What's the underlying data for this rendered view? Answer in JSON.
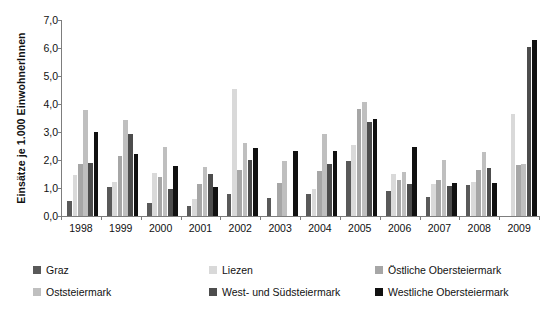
{
  "chart_data": {
    "type": "bar",
    "title": "",
    "xlabel": "",
    "ylabel": "Einsätze je 1.000 EinwohnerInnen",
    "ylim": [
      0,
      7
    ],
    "ytick_step": 1,
    "ytick_labels": [
      "0,0",
      "1,0",
      "2,0",
      "3,0",
      "4,0",
      "5,0",
      "6,0",
      "7,0"
    ],
    "ytick_values": [
      0,
      1,
      2,
      3,
      4,
      5,
      6,
      7
    ],
    "grid": false,
    "legend_position": "bottom",
    "categories": [
      "1998",
      "1999",
      "2000",
      "2001",
      "2002",
      "2003",
      "2004",
      "2005",
      "2006",
      "2007",
      "2008",
      "2009"
    ],
    "series": [
      {
        "name": "Graz",
        "color": "#595959",
        "values": [
          0.55,
          1.05,
          0.46,
          0.37,
          0.78,
          0.65,
          0.78,
          1.98,
          0.88,
          0.68,
          1.12,
          0.0
        ]
      },
      {
        "name": "Liezen",
        "color": "#d9d9d9",
        "values": [
          1.47,
          1.22,
          1.55,
          0.6,
          4.55,
          0.0,
          0.95,
          2.53,
          1.5,
          1.15,
          1.22,
          3.64
        ]
      },
      {
        "name": "Östliche Obersteiermark",
        "color": "#a6a6a6",
        "values": [
          1.84,
          2.13,
          1.38,
          1.13,
          1.63,
          1.18,
          1.6,
          3.82,
          1.3,
          1.28,
          1.64,
          1.82
        ]
      },
      {
        "name": "Oststeiermark",
        "color": "#bfbfbf",
        "values": [
          3.77,
          3.43,
          2.47,
          1.76,
          2.62,
          1.95,
          2.93,
          4.07,
          1.57,
          2.0,
          2.28,
          1.85
        ]
      },
      {
        "name": "West- und Südsteiermark",
        "color": "#4d4d4d",
        "values": [
          1.88,
          2.92,
          0.96,
          1.5,
          2.0,
          0.0,
          1.87,
          3.35,
          1.14,
          1.07,
          1.7,
          6.03
        ]
      },
      {
        "name": "Westliche Obersteiermark",
        "color": "#111111",
        "values": [
          3.01,
          2.22,
          1.79,
          1.03,
          2.42,
          2.32,
          2.31,
          3.48,
          2.47,
          1.17,
          1.18,
          6.27
        ]
      }
    ]
  },
  "legend": {
    "items": [
      {
        "label": "Graz",
        "color": "#595959"
      },
      {
        "label": "Liezen",
        "color": "#d9d9d9"
      },
      {
        "label": "Östliche Obersteiermark",
        "color": "#a6a6a6"
      },
      {
        "label": "Oststeiermark",
        "color": "#bfbfbf"
      },
      {
        "label": "West- und Südsteiermark",
        "color": "#4d4d4d"
      },
      {
        "label": "Westliche Obersteiermark",
        "color": "#111111"
      }
    ]
  }
}
